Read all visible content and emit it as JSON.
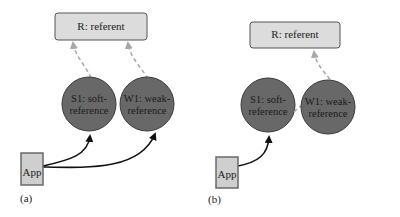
{
  "colors": {
    "referent_fill": "#dcdcdc",
    "referent_stroke": "#555555",
    "node_fill": "#686868",
    "node_stroke": "#3a3a3a",
    "app_fill": "#cfcfcf",
    "app_stroke": "#6a6a6a",
    "strong_edge": "#111111",
    "weak_edge": "#a8a8a8"
  },
  "panels": [
    {
      "label": "(a)",
      "referent": {
        "text": "R: referent"
      },
      "soft": {
        "line1": "S1: soft-",
        "line2": "reference"
      },
      "weak": {
        "line1": "W1: weak-",
        "line2": "reference"
      },
      "app": {
        "text": "App"
      },
      "edges": [
        {
          "from": "App",
          "to": "S1",
          "style": "strong"
        },
        {
          "from": "App",
          "to": "W1",
          "style": "strong"
        },
        {
          "from": "S1",
          "to": "R",
          "style": "dashed"
        },
        {
          "from": "W1",
          "to": "R",
          "style": "dashed"
        }
      ]
    },
    {
      "label": "(b)",
      "referent": {
        "text": "R: referent"
      },
      "soft": {
        "line1": "S1: soft-",
        "line2": "reference"
      },
      "weak": {
        "line1": "W1: weak-",
        "line2": "reference"
      },
      "app": {
        "text": "App"
      },
      "edges": [
        {
          "from": "App",
          "to": "S1",
          "style": "strong"
        },
        {
          "from": "S1",
          "to": "W1",
          "style": "dashed"
        },
        {
          "from": "W1",
          "to": "R",
          "style": "dashed"
        }
      ]
    }
  ]
}
